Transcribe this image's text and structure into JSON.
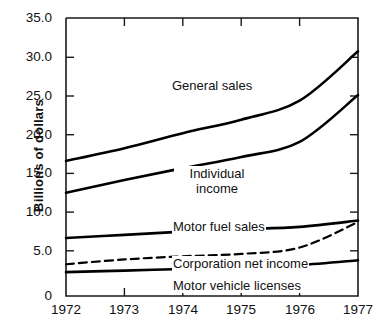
{
  "chart_data": {
    "type": "line",
    "title": "",
    "xlabel": "",
    "ylabel": "Billions of dollars",
    "x": [
      1972,
      1973,
      1974,
      1975,
      1976,
      1977
    ],
    "xtick_labels": [
      "1972",
      "1973",
      "1974",
      "1975",
      "1976",
      "1977"
    ],
    "ytick_labels": [
      "0",
      "5.0",
      "10.0",
      "15.0",
      "20.0",
      "25.0",
      "30.0",
      "35.0"
    ],
    "ytick_values": [
      0,
      5.0,
      10.0,
      15.0,
      20.0,
      25.0,
      30.0,
      35.0
    ],
    "xlim": [
      1972,
      1977
    ],
    "ylim": [
      0,
      35.0
    ],
    "grid": false,
    "legend": "inline-labels",
    "series": [
      {
        "name": "General sales",
        "style": "solid",
        "values": [
          17.0,
          18.6,
          20.5,
          22.2,
          24.6,
          30.8
        ]
      },
      {
        "name": "Individual income",
        "style": "solid",
        "values": [
          13.0,
          14.6,
          16.1,
          17.5,
          19.4,
          25.3
        ]
      },
      {
        "name": "Motor fuel sales",
        "style": "solid",
        "values": [
          7.3,
          7.7,
          8.1,
          8.4,
          8.7,
          9.5
        ]
      },
      {
        "name": "Corporation net income",
        "style": "dashed",
        "values": [
          4.0,
          4.6,
          5.0,
          5.3,
          6.1,
          9.3
        ]
      },
      {
        "name": "Motor vehicle licenses",
        "style": "solid",
        "values": [
          3.0,
          3.2,
          3.4,
          3.6,
          3.9,
          4.5
        ]
      }
    ]
  },
  "axis": {
    "y_title": "Billions of dollars"
  },
  "labels": {
    "general_sales": "General sales",
    "individual_income_line1": "Individual",
    "individual_income_line2": "income",
    "motor_fuel_sales": "Motor fuel sales",
    "corporation_net_income": "Corporation net income",
    "motor_vehicle_licenses": "Motor vehicle licenses"
  },
  "ticks": {
    "y": [
      "35.0",
      "30.0",
      "25.0",
      "20.0",
      "15.0",
      "10.0",
      "5.0",
      "0"
    ],
    "x": [
      "1972",
      "1973",
      "1974",
      "1975",
      "1976",
      "1977"
    ]
  },
  "colors": {
    "line": "#000000",
    "axis": "#1a1a1a",
    "background": "#ffffff",
    "text": "#111111"
  }
}
